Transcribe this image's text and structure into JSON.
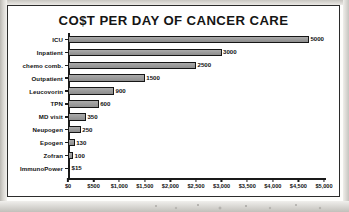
{
  "chart_data": {
    "type": "bar",
    "orientation": "horizontal",
    "title": "CO$T PER DAY OF CANCER CARE",
    "xlabel": "",
    "ylabel": "",
    "xlim": [
      0,
      5000
    ],
    "grid": false,
    "legend": false,
    "categories": [
      "ICU",
      "Inpatient",
      "chemo comb.",
      "Outpatient",
      "Leucovorin",
      "TPN",
      "MD visit",
      "Neupogen",
      "Epogen",
      "Zofran",
      "ImmunoPower"
    ],
    "values": [
      5000,
      3000,
      2500,
      1500,
      900,
      600,
      350,
      250,
      130,
      100,
      15
    ],
    "value_labels": [
      "5000",
      "3000",
      "2500",
      "1500",
      "900",
      "600",
      "350",
      "250",
      "130",
      "100",
      "$15"
    ],
    "xticks": [
      0,
      500,
      1000,
      1500,
      2000,
      2500,
      3000,
      3500,
      4000,
      4500,
      5000
    ],
    "xtick_labels": [
      "$0",
      "$500",
      "$1,000",
      "$1,500",
      "$2,000",
      "$2,500",
      "$3,000",
      "$3,500",
      "$4,000",
      "$4,500",
      "$5,000"
    ],
    "bar_fill_color": "#9d9d9d",
    "bar_edge_color": "#161616",
    "frame_color": "#2b2b2b",
    "text_color": "#111111"
  }
}
